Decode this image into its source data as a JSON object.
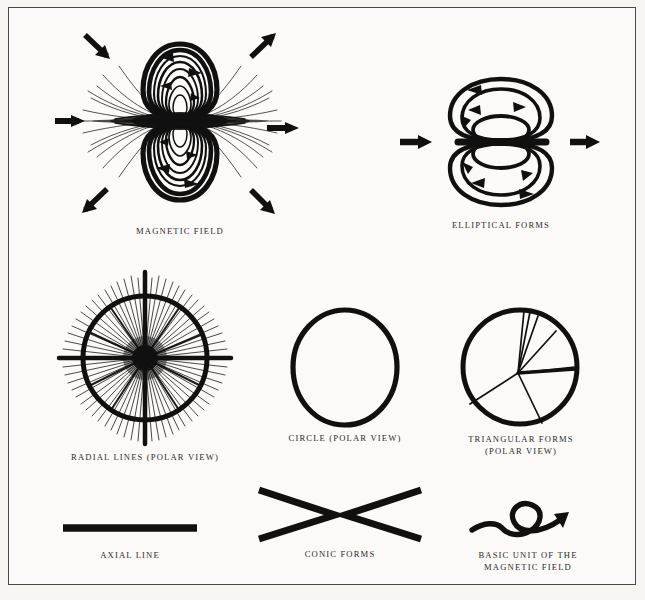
{
  "plate": {
    "background_color": "#fbfaf8",
    "border_color": "#4a4a4e",
    "ink_color": "#101010"
  },
  "figures": [
    {
      "id": "magnetic-field",
      "caption": "MAGNETIC FIELD",
      "description": "toroidal dipole field with two lobes of concentric loops, radial line burst at the equator, and six directional arrows",
      "arrow_count": 6,
      "loop_count": 14
    },
    {
      "id": "elliptical-forms",
      "caption": "ELLIPTICAL FORMS",
      "description": "two stacked lobes each containing three nested ellipses with circulation arrows, flanked by left and right arrows",
      "arrow_count": 2,
      "ellipses_per_lobe": 3
    },
    {
      "id": "radial-lines",
      "caption": "RADIAL LINES (POLAR VIEW)",
      "description": "dense radial burst of lines inside a bold circle with prominent vertical and horizontal axes"
    },
    {
      "id": "circle-polar-view",
      "caption": "CIRCLE (POLAR VIEW)",
      "description": "single hand drawn bold circle"
    },
    {
      "id": "triangular-forms",
      "caption": "TRIANGULAR FORMS\n(POLAR VIEW)",
      "description": "bold circle divided by spokes radiating from an off center point forming triangular sectors",
      "spoke_count": 7
    },
    {
      "id": "axial-line",
      "caption": "AXIAL LINE",
      "description": "single thick horizontal bar"
    },
    {
      "id": "conic-forms",
      "caption": "CONIC FORMS",
      "description": "two chevrons pointing toward each other forming opposed cones"
    },
    {
      "id": "basic-unit",
      "caption": "BASIC UNIT OF THE\nMAGNETIC FIELD",
      "description": "a curving line that loops into a circle and ends in an arrowhead"
    }
  ]
}
